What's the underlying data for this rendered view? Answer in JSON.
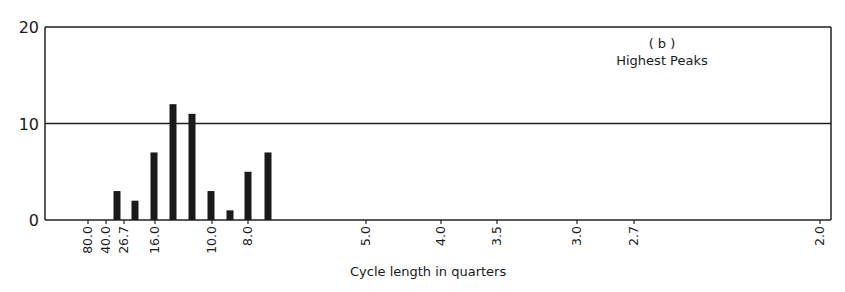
{
  "chart_data": {
    "type": "bar",
    "title": "",
    "annotation_lines": [
      "( b )",
      "Highest Peaks"
    ],
    "xlabel": "Cycle length in quarters",
    "ylabel": "",
    "ylim": [
      0,
      20
    ],
    "yticks": [
      "0",
      "10",
      "20"
    ],
    "grid": "horizontal line at 10",
    "xtick_labels": [
      "80.0",
      "40.0",
      "26.7",
      "16.0",
      "10.0",
      "8.0",
      "5.0",
      "4.0",
      "3.5",
      "3.0",
      "2.7",
      "2.0"
    ],
    "bars": [
      {
        "x_px": 117,
        "value": 3
      },
      {
        "x_px": 135,
        "value": 2
      },
      {
        "x_px": 154,
        "value": 7
      },
      {
        "x_px": 173,
        "value": 12
      },
      {
        "x_px": 192,
        "value": 11
      },
      {
        "x_px": 211,
        "value": 3
      },
      {
        "x_px": 230,
        "value": 1
      },
      {
        "x_px": 248,
        "value": 5
      },
      {
        "x_px": 268,
        "value": 7
      }
    ],
    "categories": [
      "26.7",
      "~20",
      "16.0",
      "~13.3",
      "~11.4",
      "10.0",
      "~8.9",
      "8.0",
      "~7.3"
    ],
    "values": [
      3,
      2,
      7,
      12,
      11,
      3,
      1,
      5,
      7
    ]
  },
  "layout": {
    "plot_left": 45,
    "plot_right": 831,
    "plot_top": 27,
    "plot_bottom": 220,
    "xtick_px": [
      88,
      106,
      124,
      155,
      212,
      248,
      366,
      441,
      497,
      577,
      634,
      820
    ],
    "bar_width": 7,
    "bar_color": "#1a1a1a"
  }
}
